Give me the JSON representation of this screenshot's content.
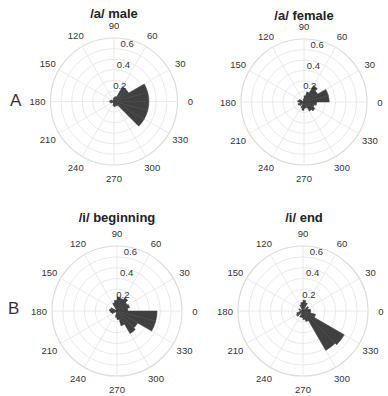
{
  "panels": [
    {
      "letter": "A"
    },
    {
      "letter": "B"
    }
  ],
  "chart_data": [
    {
      "type": "polar-histogram",
      "title": "/a/ male",
      "panel": "A",
      "rlim": [
        0,
        0.6
      ],
      "r_ticks": [
        "0.2",
        "0.4",
        "0.6"
      ],
      "theta_ticks": [
        "0",
        "30",
        "60",
        "90",
        "120",
        "150",
        "180",
        "210",
        "240",
        "270",
        "300",
        "330"
      ],
      "bin_width_deg": 15,
      "bins": [
        {
          "start": 0,
          "r": 0.33
        },
        {
          "start": 15,
          "r": 0.33
        },
        {
          "start": 30,
          "r": 0.16
        },
        {
          "start": 45,
          "r": 0.16
        },
        {
          "start": 60,
          "r": 0.05
        },
        {
          "start": 75,
          "r": 0.04
        },
        {
          "start": 90,
          "r": 0.03
        },
        {
          "start": 150,
          "r": 0.03
        },
        {
          "start": 165,
          "r": 0.04
        },
        {
          "start": 180,
          "r": 0.04
        },
        {
          "start": 195,
          "r": 0.03
        },
        {
          "start": 255,
          "r": 0.04
        },
        {
          "start": 270,
          "r": 0.05
        },
        {
          "start": 285,
          "r": 0.04
        },
        {
          "start": 300,
          "r": 0.05
        },
        {
          "start": 315,
          "r": 0.33
        },
        {
          "start": 330,
          "r": 0.33
        },
        {
          "start": 345,
          "r": 0.33
        }
      ],
      "grid": true
    },
    {
      "type": "polar-histogram",
      "title": "/a/ female",
      "panel": "A",
      "rlim": [
        0,
        0.6
      ],
      "r_ticks": [
        "0.2",
        "0.4",
        "0.6"
      ],
      "theta_ticks": [
        "0",
        "30",
        "60",
        "90",
        "120",
        "150",
        "180",
        "210",
        "240",
        "270",
        "300",
        "330"
      ],
      "bin_width_deg": 15,
      "bins": [
        {
          "start": 0,
          "r": 0.24
        },
        {
          "start": 15,
          "r": 0.24
        },
        {
          "start": 30,
          "r": 0.15
        },
        {
          "start": 45,
          "r": 0.18
        },
        {
          "start": 60,
          "r": 0.1
        },
        {
          "start": 75,
          "r": 0.06
        },
        {
          "start": 90,
          "r": 0.03
        },
        {
          "start": 150,
          "r": 0.05
        },
        {
          "start": 165,
          "r": 0.06
        },
        {
          "start": 180,
          "r": 0.04
        },
        {
          "start": 195,
          "r": 0.06
        },
        {
          "start": 210,
          "r": 0.05
        },
        {
          "start": 240,
          "r": 0.06
        },
        {
          "start": 255,
          "r": 0.08
        },
        {
          "start": 270,
          "r": 0.06
        },
        {
          "start": 285,
          "r": 0.06
        },
        {
          "start": 300,
          "r": 0.1
        },
        {
          "start": 315,
          "r": 0.12
        },
        {
          "start": 330,
          "r": 0.1
        },
        {
          "start": 345,
          "r": 0.12
        }
      ],
      "grid": true
    },
    {
      "type": "polar-histogram",
      "title": "/i/ beginning",
      "panel": "B",
      "rlim": [
        0,
        0.6
      ],
      "r_ticks": [
        "0.2",
        "0.4",
        "0.6"
      ],
      "theta_ticks": [
        "0",
        "30",
        "60",
        "90",
        "120",
        "150",
        "180",
        "210",
        "240",
        "270",
        "300",
        "330"
      ],
      "bin_width_deg": 15,
      "bins": [
        {
          "start": 0,
          "r": 0.1
        },
        {
          "start": 15,
          "r": 0.12
        },
        {
          "start": 30,
          "r": 0.11
        },
        {
          "start": 45,
          "r": 0.14
        },
        {
          "start": 60,
          "r": 0.12
        },
        {
          "start": 75,
          "r": 0.13
        },
        {
          "start": 90,
          "r": 0.1
        },
        {
          "start": 105,
          "r": 0.08
        },
        {
          "start": 150,
          "r": 0.06
        },
        {
          "start": 165,
          "r": 0.07
        },
        {
          "start": 180,
          "r": 0.06
        },
        {
          "start": 195,
          "r": 0.05
        },
        {
          "start": 255,
          "r": 0.06
        },
        {
          "start": 270,
          "r": 0.08
        },
        {
          "start": 285,
          "r": 0.14
        },
        {
          "start": 300,
          "r": 0.24
        },
        {
          "start": 315,
          "r": 0.22
        },
        {
          "start": 330,
          "r": 0.37
        },
        {
          "start": 345,
          "r": 0.37
        }
      ],
      "grid": true
    },
    {
      "type": "polar-histogram",
      "title": "/i/ end",
      "panel": "B",
      "rlim": [
        0,
        0.6
      ],
      "r_ticks": [
        "0.2",
        "0.4",
        "0.6"
      ],
      "theta_ticks": [
        "0",
        "30",
        "60",
        "90",
        "120",
        "150",
        "180",
        "210",
        "240",
        "270",
        "300",
        "330"
      ],
      "bin_width_deg": 15,
      "bins": [
        {
          "start": 0,
          "r": 0.07
        },
        {
          "start": 15,
          "r": 0.05
        },
        {
          "start": 30,
          "r": 0.06
        },
        {
          "start": 60,
          "r": 0.08
        },
        {
          "start": 75,
          "r": 0.1
        },
        {
          "start": 90,
          "r": 0.08
        },
        {
          "start": 105,
          "r": 0.06
        },
        {
          "start": 150,
          "r": 0.04
        },
        {
          "start": 180,
          "r": 0.03
        },
        {
          "start": 195,
          "r": 0.06
        },
        {
          "start": 210,
          "r": 0.07
        },
        {
          "start": 240,
          "r": 0.06
        },
        {
          "start": 255,
          "r": 0.06
        },
        {
          "start": 270,
          "r": 0.08
        },
        {
          "start": 285,
          "r": 0.1
        },
        {
          "start": 300,
          "r": 0.42
        },
        {
          "start": 315,
          "r": 0.44
        },
        {
          "start": 330,
          "r": 0.12
        },
        {
          "start": 345,
          "r": 0.07
        }
      ],
      "grid": true
    }
  ],
  "style": {
    "bar_color": "#404040",
    "grid_color": "#e4e4e4",
    "outer_ring_color": "#dcdcdc",
    "tick_label_color": "#333333"
  }
}
